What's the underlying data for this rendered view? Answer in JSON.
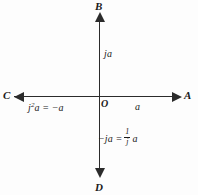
{
  "diagram": {
    "background_color": "#fdfdfd",
    "line_color": "#2b2b2b",
    "origin_label": "O",
    "axes": {
      "horizontal": {
        "positive_endpoint": "A",
        "negative_endpoint": "C"
      },
      "vertical": {
        "positive_endpoint": "B",
        "negative_endpoint": "D"
      }
    },
    "endpoints": {
      "right": "A",
      "top": "B",
      "left": "C",
      "bottom": "D"
    },
    "annotations": {
      "positive_real": "a",
      "positive_imaginary": "ja",
      "negative_real_expr": "j",
      "negative_real_exponent": "2",
      "negative_real_rest": "a = −a",
      "negative_imaginary_lead": "−ja =",
      "fraction_numerator": "1",
      "fraction_denominator": "j",
      "fraction_trailing": "a"
    },
    "arrows": {
      "right": "arrow-right-icon",
      "left": "arrow-left-icon",
      "up": "arrow-up-icon",
      "down": "arrow-down-icon"
    }
  }
}
